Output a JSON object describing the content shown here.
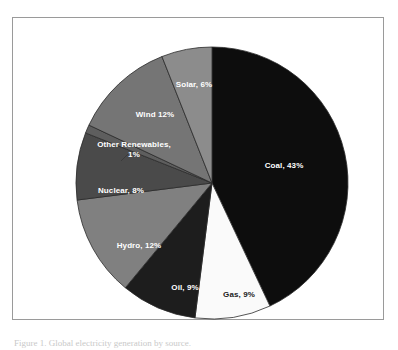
{
  "figure": {
    "background_color": "#ffffff",
    "frame_color": "#9a9a9a",
    "caption": "Figure 1. Global electricity generation by source."
  },
  "chart_data": {
    "type": "pie",
    "title": "",
    "subtitle": "",
    "xlabel": "",
    "ylabel": "",
    "legend_position": "none",
    "grid": false,
    "labels_inside": true,
    "start_angle_deg": 0,
    "direction": "clockwise",
    "units": "percent",
    "total": 100,
    "categories": [
      "Coal",
      "Gas",
      "Oil",
      "Hydro",
      "Nuclear",
      "Other Renewables",
      "Wind",
      "Solar"
    ],
    "values": [
      43,
      9,
      9,
      12,
      8,
      1,
      12,
      6
    ],
    "slices": [
      {
        "name": "Coal",
        "value": 43,
        "label": "Coal, 43%",
        "color": "#0d0d0d",
        "text_color": "#ffffff",
        "label_x": 271,
        "label_y": 148,
        "lines": 1
      },
      {
        "name": "Gas",
        "value": 9,
        "label": "Gas, 9%",
        "color": "#fafafa",
        "text_color": "#1a1a1a",
        "label_x": 226,
        "label_y": 277,
        "lines": 1
      },
      {
        "name": "Oil",
        "value": 9,
        "label": "Oil, 9%",
        "color": "#1d1d1d",
        "text_color": "#ffffff",
        "label_x": 172,
        "label_y": 270,
        "lines": 1
      },
      {
        "name": "Hydro",
        "value": 12,
        "label": "Hydro, 12%",
        "color": "#808080",
        "text_color": "#ffffff",
        "label_x": 126,
        "label_y": 228,
        "lines": 1
      },
      {
        "name": "Nuclear",
        "value": 8,
        "label": "Nuclear, 8%",
        "color": "#4a4a4a",
        "text_color": "#ffffff",
        "label_x": 108,
        "label_y": 173,
        "lines": 1
      },
      {
        "name": "Other Renewables",
        "value": 1,
        "label": "Other Renewables, 1%",
        "color": "#5e5e5e",
        "text_color": "#ffffff",
        "label_x": 121,
        "label_y": 132,
        "lines": 2
      },
      {
        "name": "Wind",
        "value": 12,
        "label": "Wind 12%",
        "color": "#757575",
        "text_color": "#ffffff",
        "label_x": 142,
        "label_y": 97,
        "lines": 1
      },
      {
        "name": "Solar",
        "value": 6,
        "label": "Solar, 6%",
        "color": "#8c8c8c",
        "text_color": "#ffffff",
        "label_x": 181,
        "label_y": 67,
        "lines": 1
      }
    ],
    "geometry": {
      "center_x": 199,
      "center_y": 165,
      "radius": 136,
      "slice_border_color": "#2b2b2b",
      "slice_border_width": 0.8
    }
  }
}
